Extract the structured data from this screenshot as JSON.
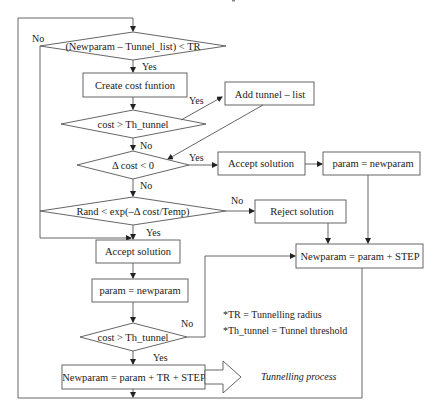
{
  "nodes": {
    "d1": "(Newparam – Tunnel_list) < TR",
    "create_cost": "Create cost funtion",
    "d2": "cost > Th_tunnel",
    "add_tunnel": "Add tunnel – list",
    "d3": "Δ cost < 0",
    "accept1": "Accept solution",
    "param1": "param = newparam",
    "d4": "Rand < exp(–Δ cost/Temp)",
    "reject": "Reject solution",
    "accept2": "Accept solution",
    "newparam_step": "Newparam = param + STEP",
    "param2": "param = newparam",
    "d5": "cost > Th_tunnel",
    "newparam_tr": "Newparam = param + TR + STEP"
  },
  "labels": {
    "d1_no": "No",
    "d1_yes": "Yes",
    "d2_yes": "Yes",
    "d2_no": "No",
    "d3_yes": "Yes",
    "d3_no": "No",
    "d4_no": "No",
    "d4_yes": "Yes",
    "d5_no": "No",
    "d5_yes": "Yes"
  },
  "notes": {
    "tr": "*TR = Tunnelling radius",
    "th": "*Th_tunnel = Tunnel threshold"
  },
  "tunnelling_label": "Tunnelling process"
}
